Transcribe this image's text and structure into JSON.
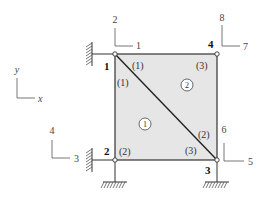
{
  "diagram": {
    "type": "finite-element-mesh",
    "colors": {
      "fill": "#e6e6e6",
      "edge": "#333333",
      "label": "#333333"
    },
    "axes": {
      "y_label": "y",
      "x_label": "x"
    },
    "nodes": [
      {
        "id": "1",
        "label": "1",
        "support": "fixed-left"
      },
      {
        "id": "2",
        "label": "2",
        "support": "fixed-left-and-bottom"
      },
      {
        "id": "3",
        "label": "3",
        "support": "fixed-bottom"
      },
      {
        "id": "4",
        "label": "4",
        "support": "none"
      }
    ],
    "dofs": [
      {
        "node": "1",
        "x_dof": "1",
        "y_dof": "2"
      },
      {
        "node": "2",
        "x_dof": "3",
        "y_dof": "4"
      },
      {
        "node": "3",
        "x_dof": "5",
        "y_dof": "6"
      },
      {
        "node": "4",
        "x_dof": "7",
        "y_dof": "8"
      }
    ],
    "elements": [
      {
        "id": "1",
        "label": "1",
        "local_labels": [
          "(1)",
          "(2)",
          "(3)"
        ]
      },
      {
        "id": "2",
        "label": "2",
        "local_labels": [
          "(1)",
          "(2)",
          "(3)"
        ]
      }
    ]
  }
}
